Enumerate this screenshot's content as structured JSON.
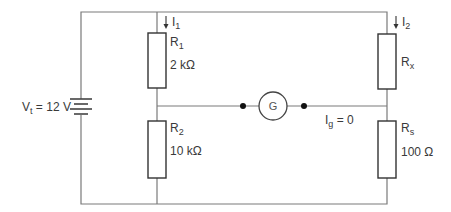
{
  "diagram": {
    "type": "wheatstone-bridge-circuit",
    "source": {
      "label_main": "V",
      "label_sub": "t",
      "label_value": " = 12 V"
    },
    "branches": {
      "left": {
        "current": {
          "main": "I",
          "sub": "1"
        },
        "top_resistor": {
          "name_main": "R",
          "name_sub": "1",
          "value": "2 kΩ"
        },
        "bottom_resistor": {
          "name_main": "R",
          "name_sub": "2",
          "value": "10 kΩ"
        }
      },
      "right": {
        "current": {
          "main": "I",
          "sub": "2"
        },
        "top_resistor": {
          "name_main": "R",
          "name_sub": "x",
          "value": ""
        },
        "bottom_resistor": {
          "name_main": "R",
          "name_sub": "s",
          "value": "100 Ω"
        }
      }
    },
    "galvanometer": {
      "symbol": "G",
      "current_main": "I",
      "current_sub": "g",
      "current_value": " = 0"
    },
    "colors": {
      "wire": "#7a7a7a",
      "component": "#333333",
      "text": "#3a3a3a"
    }
  }
}
